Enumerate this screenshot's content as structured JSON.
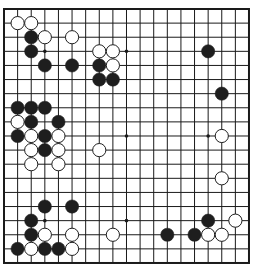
{
  "board": {
    "size": 19,
    "origin_x": 4,
    "origin_y": 9,
    "spacing_x": 13.61,
    "spacing_y": 14.11,
    "stone_radius": 6.6,
    "line_color": "#1a1a1a",
    "border_color": "#1a1a1a",
    "background": "#ffffff",
    "black_color": "#1e1e1e",
    "white_fill": "#ffffff",
    "white_stroke": "#1e1e1e",
    "star_points": [
      [
        3,
        3
      ],
      [
        9,
        3
      ],
      [
        15,
        3
      ],
      [
        3,
        9
      ],
      [
        9,
        9
      ],
      [
        15,
        9
      ],
      [
        3,
        15
      ],
      [
        9,
        15
      ],
      [
        15,
        15
      ]
    ],
    "stones": [
      {
        "color": "white",
        "col": 1,
        "row": 1
      },
      {
        "color": "white",
        "col": 2,
        "row": 1
      },
      {
        "color": "black",
        "col": 2,
        "row": 2
      },
      {
        "color": "white",
        "col": 3,
        "row": 2
      },
      {
        "color": "white",
        "col": 5,
        "row": 2
      },
      {
        "color": "black",
        "col": 2,
        "row": 3
      },
      {
        "color": "white",
        "col": 7,
        "row": 3
      },
      {
        "color": "white",
        "col": 8,
        "row": 3
      },
      {
        "color": "black",
        "col": 15,
        "row": 3
      },
      {
        "color": "black",
        "col": 3,
        "row": 4
      },
      {
        "color": "black",
        "col": 5,
        "row": 4
      },
      {
        "color": "black",
        "col": 7,
        "row": 4
      },
      {
        "color": "white",
        "col": 8,
        "row": 4
      },
      {
        "color": "black",
        "col": 7,
        "row": 5
      },
      {
        "color": "black",
        "col": 8,
        "row": 5
      },
      {
        "color": "black",
        "col": 16,
        "row": 6
      },
      {
        "color": "black",
        "col": 1,
        "row": 7
      },
      {
        "color": "black",
        "col": 2,
        "row": 7
      },
      {
        "color": "black",
        "col": 3,
        "row": 7
      },
      {
        "color": "white",
        "col": 1,
        "row": 8
      },
      {
        "color": "black",
        "col": 2,
        "row": 8
      },
      {
        "color": "black",
        "col": 4,
        "row": 8
      },
      {
        "color": "black",
        "col": 1,
        "row": 9
      },
      {
        "color": "white",
        "col": 2,
        "row": 9
      },
      {
        "color": "black",
        "col": 3,
        "row": 9
      },
      {
        "color": "white",
        "col": 4,
        "row": 9
      },
      {
        "color": "white",
        "col": 16,
        "row": 9
      },
      {
        "color": "white",
        "col": 2,
        "row": 10
      },
      {
        "color": "black",
        "col": 3,
        "row": 10
      },
      {
        "color": "white",
        "col": 4,
        "row": 10
      },
      {
        "color": "white",
        "col": 7,
        "row": 10
      },
      {
        "color": "white",
        "col": 2,
        "row": 11
      },
      {
        "color": "white",
        "col": 4,
        "row": 11
      },
      {
        "color": "white",
        "col": 16,
        "row": 12
      },
      {
        "color": "black",
        "col": 3,
        "row": 14
      },
      {
        "color": "black",
        "col": 5,
        "row": 14
      },
      {
        "color": "black",
        "col": 2,
        "row": 15
      },
      {
        "color": "black",
        "col": 15,
        "row": 15
      },
      {
        "color": "white",
        "col": 17,
        "row": 15
      },
      {
        "color": "black",
        "col": 2,
        "row": 16
      },
      {
        "color": "white",
        "col": 3,
        "row": 16
      },
      {
        "color": "white",
        "col": 5,
        "row": 16
      },
      {
        "color": "white",
        "col": 8,
        "row": 16
      },
      {
        "color": "black",
        "col": 12,
        "row": 16
      },
      {
        "color": "black",
        "col": 14,
        "row": 16
      },
      {
        "color": "white",
        "col": 15,
        "row": 16
      },
      {
        "color": "white",
        "col": 16,
        "row": 16
      },
      {
        "color": "black",
        "col": 1,
        "row": 17
      },
      {
        "color": "white",
        "col": 2,
        "row": 17
      },
      {
        "color": "black",
        "col": 3,
        "row": 17
      },
      {
        "color": "black",
        "col": 4,
        "row": 17
      },
      {
        "color": "white",
        "col": 5,
        "row": 17
      }
    ]
  }
}
